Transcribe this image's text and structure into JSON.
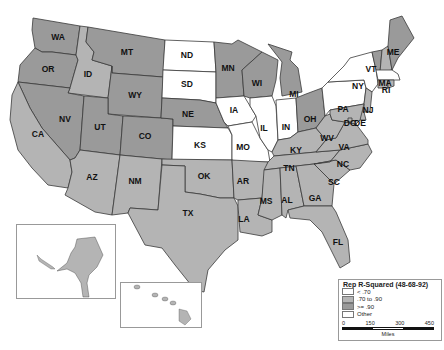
{
  "legend": {
    "title": "Rep R-Squared (48-68-92)",
    "classes": [
      {
        "label": "< .70",
        "color": "#ffffff"
      },
      {
        "label": ".70 to .90",
        "color": "#b4b4b4"
      },
      {
        "label": ">= .90",
        "color": "#9a9a9a"
      },
      {
        "label": "Other",
        "color": "#ffffff"
      }
    ],
    "scale": {
      "ticks": [
        "0",
        "150",
        "300",
        "450"
      ],
      "unit": "Miles"
    }
  },
  "colors": {
    "low": "#ffffff",
    "mid": "#b4b4b4",
    "high": "#9a9a9a",
    "border": "#3a3a3a"
  },
  "states": {
    "WA": "high",
    "OR": "high",
    "ID": "mid",
    "MT": "high",
    "WY": "high",
    "NV": "high",
    "UT": "high",
    "CO": "high",
    "CA": "mid",
    "AZ": "mid",
    "NM": "mid",
    "TX": "mid",
    "OK": "mid",
    "KS": "low",
    "NE": "high",
    "SD": "low",
    "ND": "low",
    "MN": "high",
    "IA": "low",
    "MO": "low",
    "AR": "mid",
    "LA": "mid",
    "WI": "high",
    "IL": "low",
    "MI": "high",
    "IN": "low",
    "OH": "high",
    "KY": "mid",
    "TN": "mid",
    "MS": "mid",
    "AL": "mid",
    "GA": "mid",
    "FL": "mid",
    "SC": "mid",
    "NC": "mid",
    "VA": "mid",
    "WV": "mid",
    "PA": "low",
    "NY": "low",
    "VT": "high",
    "NH": "mid",
    "ME": "high",
    "MA": "low",
    "RI": "mid",
    "CT": "mid",
    "NJ": "mid",
    "DE": "mid",
    "MD": "mid",
    "DC": "mid",
    "AK": "mid",
    "HI": "mid"
  },
  "labels": {
    "WA": "WA",
    "OR": "OR",
    "ID": "ID",
    "MT": "MT",
    "WY": "WY",
    "NV": "NV",
    "UT": "UT",
    "CO": "CO",
    "CA": "CA",
    "AZ": "AZ",
    "NM": "NM",
    "TX": "TX",
    "OK": "OK",
    "KS": "KS",
    "NE": "NE",
    "SD": "SD",
    "ND": "ND",
    "MN": "MN",
    "IA": "IA",
    "MO": "MO",
    "AR": "AR",
    "LA": "LA",
    "WI": "WI",
    "IL": "IL",
    "MI": "MI",
    "IN": "IN",
    "OH": "OH",
    "KY": "KY",
    "TN": "TN",
    "MS": "MS",
    "AL": "AL",
    "GA": "GA",
    "FL": "FL",
    "SC": "SC",
    "NC": "NC",
    "VA": "VA",
    "WV": "WV",
    "PA": "PA",
    "NY": "NY",
    "VT": "VT",
    "ME": "ME",
    "MA": "MA",
    "RI": "RI",
    "NJ": "NJ",
    "DE": "DE",
    "DC": "DC"
  }
}
